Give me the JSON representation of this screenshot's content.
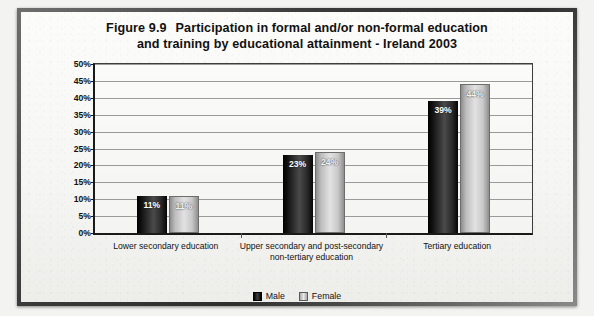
{
  "figure": {
    "title_line1_number": "Figure 9.9",
    "title_line1_text": "Participation in formal and/or non-formal education",
    "title_line2": "and training by educational attainment - Ireland 2003"
  },
  "legend": {
    "male_label": "Male",
    "female_label": "Female",
    "male_color": "#1a1a1a",
    "female_color": "#d4d4d4"
  },
  "chart_data": {
    "type": "bar",
    "xlabel": "",
    "ylabel": "",
    "ylim": [
      0,
      50
    ],
    "ytick_labels": [
      "0%",
      "5%",
      "10%",
      "15%",
      "20%",
      "25%",
      "30%",
      "35%",
      "40%",
      "45%",
      "50%"
    ],
    "ytick_values": [
      0,
      5,
      10,
      15,
      20,
      25,
      30,
      35,
      40,
      45,
      50
    ],
    "grid": true,
    "legend_position": "bottom-center",
    "categories": [
      "Lower secondary education",
      "Upper secondary and post-secondary non-tertiary education",
      "Tertiary education"
    ],
    "series": [
      {
        "name": "Male",
        "values": [
          11,
          23,
          39
        ],
        "labels": [
          "11%",
          "23%",
          "39%"
        ]
      },
      {
        "name": "Female",
        "values": [
          11,
          24,
          44
        ],
        "labels": [
          "11%",
          "24%",
          "44%"
        ]
      }
    ]
  }
}
